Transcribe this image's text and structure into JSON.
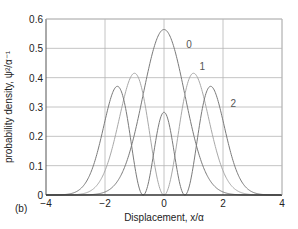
{
  "chart_data": {
    "type": "line",
    "title": "",
    "panel_label": "(b)",
    "xlabel": "Displacement, x/α",
    "ylabel": "probability density, ψ²/α⁻¹",
    "xlim": [
      -4,
      4
    ],
    "ylim": [
      0,
      0.6
    ],
    "xticks": [
      -4,
      -2,
      0,
      2,
      4
    ],
    "xtick_labels": [
      "−4",
      "−2",
      "0",
      "2",
      "4"
    ],
    "yticks": [
      0,
      0.1,
      0.2,
      0.3,
      0.4,
      0.5,
      0.6
    ],
    "ytick_labels": [
      "0",
      "0.1",
      "0.2",
      "0.3",
      "0.4",
      "0.5",
      "0.6"
    ],
    "grid": true,
    "legend": "inline curve labels",
    "series": [
      {
        "name": "0",
        "label": "0",
        "label_pos": [
          0.75,
          0.5
        ],
        "color": "#7a7a7a",
        "description": "ground state ψ0² = exp(-x²)/√π",
        "x": [
          -4,
          -3,
          -2.5,
          -2,
          -1.5,
          -1,
          -0.5,
          0,
          0.5,
          1,
          1.5,
          2,
          2.5,
          3,
          4
        ],
        "y": [
          0.0,
          0.0001,
          0.001,
          0.01,
          0.059,
          0.208,
          0.439,
          0.564,
          0.439,
          0.208,
          0.059,
          0.01,
          0.001,
          0.0001,
          0.0
        ]
      },
      {
        "name": "1",
        "label": "1",
        "label_pos": [
          1.2,
          0.425
        ],
        "color": "#a8a8a8",
        "description": "first excited ψ1² = 2x²exp(-x²)/√π",
        "x": [
          -4,
          -3,
          -2.5,
          -2,
          -1.5,
          -1,
          -0.5,
          0,
          0.5,
          1,
          1.5,
          2,
          2.5,
          3,
          4
        ],
        "y": [
          0.0,
          0.001,
          0.011,
          0.083,
          0.119,
          0.415,
          0.22,
          0.0,
          0.22,
          0.415,
          0.119,
          0.083,
          0.011,
          0.001,
          0.0
        ]
      },
      {
        "name": "2",
        "label": "2",
        "label_pos": [
          2.25,
          0.3
        ],
        "color": "#7a7a7a",
        "description": "second excited ψ2² = (2x²-1)²exp(-x²)/(2√π)",
        "x": [
          -4,
          -3,
          -2.5,
          -2,
          -1.7,
          -1.5,
          -1.2,
          -0.71,
          -0.4,
          0,
          0.4,
          0.71,
          1.2,
          1.5,
          1.7,
          2,
          2.5,
          3,
          4
        ],
        "y": [
          0.0,
          0.004,
          0.042,
          0.244,
          0.35,
          0.364,
          0.17,
          0.0,
          0.12,
          0.282,
          0.12,
          0.0,
          0.17,
          0.364,
          0.35,
          0.244,
          0.042,
          0.004,
          0.0
        ]
      }
    ]
  }
}
